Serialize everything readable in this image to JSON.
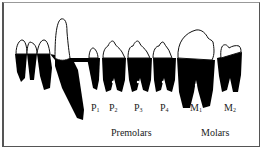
{
  "diagram": {
    "tooth_labels": [
      {
        "letter": "P",
        "sub": "1"
      },
      {
        "letter": "P",
        "sub": "2"
      },
      {
        "letter": "P",
        "sub": "3"
      },
      {
        "letter": "P",
        "sub": "4"
      },
      {
        "letter": "M",
        "sub": "1"
      },
      {
        "letter": "M",
        "sub": "2"
      }
    ],
    "groups": {
      "premolars": "Premolars",
      "molars": "Molars"
    },
    "colors": {
      "root": "#000000",
      "crown_outline": "#111111",
      "background": "#ffffff"
    }
  }
}
